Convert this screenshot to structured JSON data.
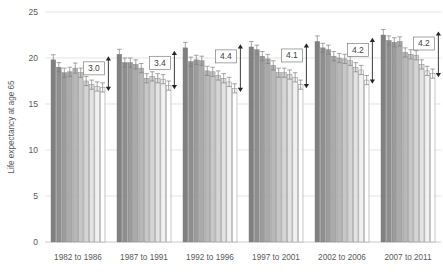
{
  "chart_data": {
    "type": "bar",
    "title": "",
    "subtitle": "",
    "xlabel": "",
    "ylabel": "Life expectancy at age 65",
    "ylim": [
      0,
      25
    ],
    "yticks": [
      0,
      5,
      10,
      15,
      20,
      25
    ],
    "ytick_labels": [
      "0",
      "5",
      "10",
      "15",
      "20",
      "25"
    ],
    "grid": true,
    "legend": "none",
    "categories": [
      "1982 to 1986",
      "1987 to 1991",
      "1992 to 1996",
      "1997 to 2001",
      "2002 to 2006",
      "2007 to 2011"
    ],
    "bars_per_group": 10,
    "series_note": "Ten deprivation deciles per period, ordered least deprived (darkest) to most deprived (lightest)",
    "groups": [
      {
        "category": "1982 to 1986",
        "values": [
          19.8,
          19.0,
          18.4,
          18.5,
          18.9,
          18.4,
          17.5,
          17.1,
          16.9,
          16.8
        ],
        "errors": [
          0.55,
          0.5,
          0.5,
          0.5,
          0.55,
          0.5,
          0.5,
          0.5,
          0.5,
          0.5
        ],
        "gap": "3.0"
      },
      {
        "category": "1987 to 1991",
        "values": [
          20.4,
          19.5,
          19.5,
          19.3,
          18.9,
          17.8,
          18.0,
          17.8,
          17.7,
          17.0
        ],
        "errors": [
          0.55,
          0.5,
          0.5,
          0.5,
          0.5,
          0.5,
          0.5,
          0.5,
          0.5,
          0.5
        ],
        "gap": "3.4"
      },
      {
        "category": "1992 to 1996",
        "values": [
          21.1,
          19.6,
          19.8,
          19.7,
          18.6,
          18.5,
          18.1,
          17.8,
          17.4,
          16.7
        ],
        "errors": [
          0.6,
          0.5,
          0.5,
          0.5,
          0.5,
          0.5,
          0.5,
          0.5,
          0.5,
          0.5
        ],
        "gap": "4.4"
      },
      {
        "category": "1997 to 2001",
        "values": [
          21.2,
          20.9,
          20.2,
          19.9,
          19.2,
          18.4,
          18.4,
          18.2,
          17.9,
          17.1
        ],
        "errors": [
          0.6,
          0.5,
          0.5,
          0.5,
          0.5,
          0.5,
          0.5,
          0.5,
          0.5,
          0.5
        ],
        "gap": "4.1"
      },
      {
        "category": "2002 to 2006",
        "values": [
          21.8,
          21.1,
          20.9,
          20.2,
          20.0,
          19.9,
          19.7,
          19.0,
          18.7,
          17.6
        ],
        "errors": [
          0.6,
          0.5,
          0.5,
          0.5,
          0.5,
          0.5,
          0.5,
          0.5,
          0.5,
          0.5
        ],
        "gap": "4.2"
      },
      {
        "category": "2007 to 2011",
        "values": [
          22.5,
          21.9,
          21.7,
          21.8,
          20.6,
          20.4,
          20.3,
          19.3,
          18.6,
          18.3
        ],
        "errors": [
          0.6,
          0.5,
          0.5,
          0.5,
          0.5,
          0.5,
          0.5,
          0.5,
          0.5,
          0.5
        ],
        "gap": "4.2"
      }
    ],
    "annotations": [
      {
        "label": "3.0",
        "group": "1982 to 1986"
      },
      {
        "label": "3.4",
        "group": "1987 to 1991"
      },
      {
        "label": "4.4",
        "group": "1992 to 1996"
      },
      {
        "label": "4.1",
        "group": "1997 to 2001"
      },
      {
        "label": "4.2",
        "group": "2002 to 2006"
      },
      {
        "label": "4.2",
        "group": "2007 to 2011"
      }
    ],
    "colors": {
      "bar_darkest": "#808080",
      "bar_lightest": "#ffffff",
      "bar_outline": "#808080",
      "gridline": "#d9d9d9",
      "text": "#595959",
      "annotation_text": "#404040",
      "error_bar": "#7f7f7f",
      "arrow": "#262626",
      "background": "#ffffff"
    }
  }
}
